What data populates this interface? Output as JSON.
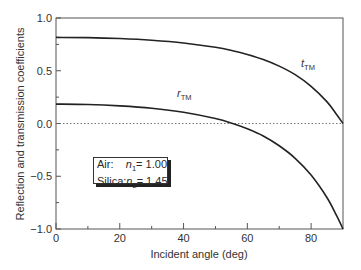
{
  "chart_data": {
    "type": "line",
    "title": "",
    "xlabel": "Incident angle (deg)",
    "ylabel": "Reflection and transmission coefficients",
    "xlim": [
      0,
      90
    ],
    "ylim": [
      -1.0,
      1.0
    ],
    "xticks": [
      0,
      20,
      40,
      60,
      80
    ],
    "xticks_minor": [
      10,
      30,
      50,
      70
    ],
    "yticks": [
      "1.0",
      "0.5",
      "0.0",
      "-0.5",
      "-1.0"
    ],
    "ytick_values": [
      1.0,
      0.5,
      0.0,
      -0.5,
      -1.0
    ],
    "yticks_minor": [
      0.75,
      0.25,
      -0.25,
      -0.75
    ],
    "grid": false,
    "zero_line": "dotted",
    "x": [
      0,
      10,
      20,
      30,
      40,
      50,
      55.4,
      60,
      65,
      70,
      75,
      80,
      85,
      88,
      90
    ],
    "series": [
      {
        "name": "t_TM",
        "label": "t",
        "label_sub": "TM",
        "values": [
          0.816,
          0.814,
          0.805,
          0.789,
          0.763,
          0.722,
          0.69,
          0.655,
          0.607,
          0.544,
          0.463,
          0.352,
          0.205,
          0.085,
          0.0
        ]
      },
      {
        "name": "r_TM",
        "label": "r",
        "label_sub": "TM",
        "values": [
          0.184,
          0.18,
          0.167,
          0.145,
          0.107,
          0.047,
          0.0,
          -0.05,
          -0.118,
          -0.211,
          -0.33,
          -0.489,
          -0.704,
          -0.874,
          -1.0
        ]
      }
    ],
    "annotations": [
      {
        "text": "Air:",
        "value": "n1 = 1.00"
      },
      {
        "text": "Silica:",
        "value": "n2 = 1.45"
      }
    ],
    "legend_position": "lower-left inside"
  },
  "legend": {
    "rows": [
      {
        "medium": "Air:",
        "n_symbol": "n",
        "n_sub": "1",
        "n_value": " = 1.00"
      },
      {
        "medium": "Silica:",
        "n_symbol": "n",
        "n_sub": "2",
        "n_value": " = 1.45"
      }
    ]
  },
  "labels": {
    "t_main": "t",
    "t_sub": "TM",
    "r_main": "r",
    "r_sub": "TM"
  },
  "axes": {
    "xlabel": "Incident angle (deg)",
    "ylabel": "Reflection and transmission coefficients"
  }
}
